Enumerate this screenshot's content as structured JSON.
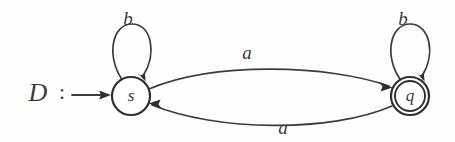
{
  "figure": {
    "kind": "finite-state-automaton-diagram",
    "machine_label": "D",
    "machine_label_separator": ":",
    "background_color": "#fefefe",
    "ink_color": "#3a3a3a"
  },
  "states": [
    {
      "id": "s",
      "label": "s",
      "kind": "start",
      "accepting": false,
      "cx": 131,
      "cy": 96,
      "r": 19
    },
    {
      "id": "q",
      "label": "q",
      "kind": "accepting",
      "accepting": true,
      "cx": 410,
      "cy": 96,
      "r": 19,
      "inner_r": 15
    }
  ],
  "transitions": [
    {
      "id": "s-self-b",
      "from": "s",
      "to": "s",
      "symbol": "b",
      "shape": "self-loop-top",
      "label_x": 128,
      "label_y": 21
    },
    {
      "id": "s-to-q-a",
      "from": "s",
      "to": "q",
      "symbol": "a",
      "shape": "arc-upper",
      "label_x": 247,
      "label_y": 55
    },
    {
      "id": "q-to-s-a",
      "from": "q",
      "to": "s",
      "symbol": "a",
      "shape": "arc-lower",
      "label_x": 283,
      "label_y": 130
    },
    {
      "id": "q-self-b",
      "from": "q",
      "to": "q",
      "symbol": "b",
      "shape": "self-loop-top",
      "label_x": 403,
      "label_y": 21
    }
  ],
  "start_marker": {
    "label": "D",
    "separator": ":",
    "label_x": 38,
    "separator_x": 62,
    "baseline_y": 95,
    "arrow_from_x": 72,
    "arrow_to_x": 110
  },
  "alphabet": [
    "a",
    "b"
  ]
}
